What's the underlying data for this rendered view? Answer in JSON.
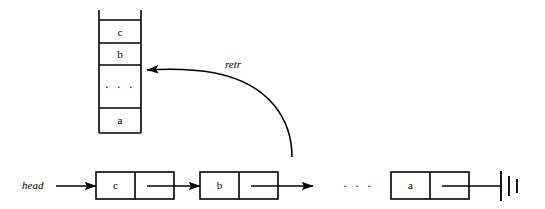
{
  "diagram": {
    "stroke_color": "#000000",
    "background_color": "#ffffff",
    "stack": {
      "name": "stack-column",
      "cells": [
        {
          "label": "c"
        },
        {
          "label": "b"
        },
        {
          "label": "· · ·"
        },
        {
          "label": "a"
        }
      ]
    },
    "retr_arrow": {
      "label": "retr"
    },
    "list": {
      "head_label": "head",
      "nodes": [
        {
          "value": "c"
        },
        {
          "value": "b"
        },
        {
          "value": "a"
        }
      ],
      "ellipsis": "· · ·",
      "terminator": "ground-null"
    }
  }
}
